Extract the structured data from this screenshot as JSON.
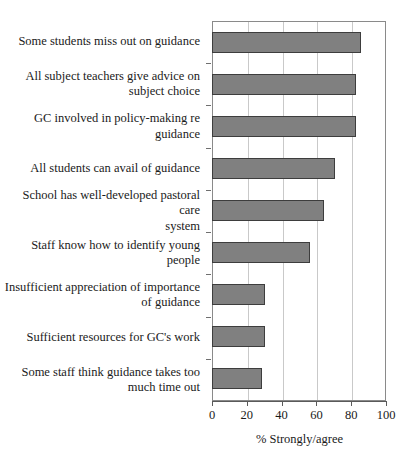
{
  "chart_data": {
    "type": "bar",
    "orientation": "horizontal",
    "title": "",
    "xlabel": "% Strongly/agree",
    "ylabel": "",
    "xlim": [
      0,
      100
    ],
    "xticks": [
      0,
      20,
      40,
      60,
      80,
      100
    ],
    "xtick_labels": [
      "0",
      "20",
      "40",
      "60",
      "80",
      "100"
    ],
    "grid": "vertical",
    "legend": "none",
    "bar_color": "#808080",
    "bar_edge_color": "#3d3d3d",
    "categories": [
      "Some students miss out on guidance",
      "All subject teachers give advice on subject choice",
      "GC involved in policy-making re guidance",
      "All students can avail of guidance",
      "School has well-developed pastoral care system",
      "Staff know how to identify young people",
      "Insufficient appreciation of importance of guidance",
      "Sufficient resources for GC's work",
      "Some staff think guidance takes too much time out"
    ],
    "category_lines": [
      [
        "Some students miss out on guidance"
      ],
      [
        "All subject teachers give advice on",
        "subject choice"
      ],
      [
        "GC involved in policy-making re",
        "guidance"
      ],
      [
        "All students can avail of guidance"
      ],
      [
        "School has well-developed pastoral care",
        "system"
      ],
      [
        "Staff know how to identify young",
        "people"
      ],
      [
        "Insufficient appreciation of importance",
        "of guidance"
      ],
      [
        "Sufficient resources for GC's work"
      ],
      [
        "Some staff think guidance takes too",
        "much time out"
      ]
    ],
    "values": [
      85,
      82,
      82,
      70,
      64,
      56,
      30,
      30,
      28
    ]
  }
}
